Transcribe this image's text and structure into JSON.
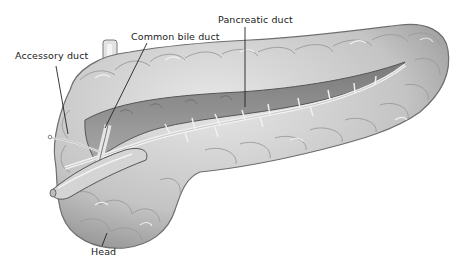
{
  "diagram": {
    "labels": {
      "accessory_duct": "Accessory duct",
      "common_bile_duct": "Common bile duct",
      "pancreatic_duct": "Pancreatic duct",
      "head": "Head"
    },
    "colors": {
      "background": "#ffffff",
      "tissue_light": "#d9d9d9",
      "tissue_mid": "#bdbdbd",
      "tissue_dark": "#8a8a8a",
      "outline": "#6e6e6e",
      "duct_highlight": "#f2f2f2",
      "leader_line": "#222222",
      "text": "#222222"
    }
  }
}
